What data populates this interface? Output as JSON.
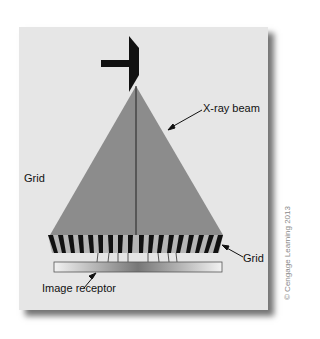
{
  "diagram": {
    "labels": {
      "beam": "X-ray beam",
      "grid_left": "Grid",
      "grid_right": "Grid",
      "receptor": "Image receptor"
    },
    "credit": "© Cengage Learning 2013",
    "colors": {
      "panel": "#e6e6e6",
      "beam": "#8c8c8c",
      "tube": "#111111",
      "grid_strip": "#111111",
      "grid_gap": "#b5b5b5"
    }
  }
}
